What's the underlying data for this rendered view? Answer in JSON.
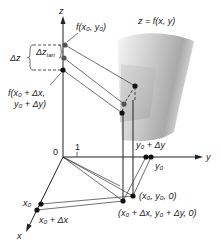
{
  "diagram": {
    "type": "3d-increment-figure",
    "axes": {
      "z_label": "z",
      "y_label": "y",
      "x_label": "x",
      "origin_label": "0",
      "unit_tick_label": "1"
    },
    "surface_label": "z = f(x, y)",
    "labels": {
      "f_x0_y0": "f(x₀, y₀)",
      "f_shift_line1": "f(x₀ + Δx,",
      "f_shift_line2": "y₀ + Δy)",
      "delta_z": "Δz",
      "delta_z_tan": "Δz",
      "delta_z_tan_sub": "tan",
      "y0": "y₀",
      "y0_plus_dy": "y₀ + Δy",
      "x0": "x₀",
      "x0_plus_dx": "x₀ + Δx",
      "base_point": "(x₀, y₀, 0)",
      "base_point_shift": "(x₀ + Δx, y₀ + Δy, 0)"
    },
    "colors": {
      "ink": "#222222",
      "surface_light": "#f2f2f2",
      "surface_dark": "#9a9a9a",
      "tangent_plane": "#c8c8c8"
    }
  }
}
